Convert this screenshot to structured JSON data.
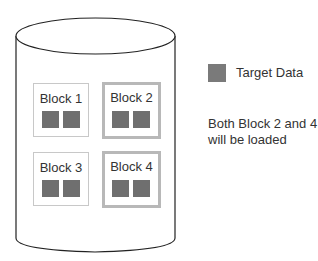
{
  "diagram": {
    "container": "cylinder",
    "blocks": [
      {
        "label": "Block 1",
        "highlighted": false
      },
      {
        "label": "Block 2",
        "highlighted": true
      },
      {
        "label": "Block 3",
        "highlighted": false
      },
      {
        "label": "Block 4",
        "highlighted": true
      }
    ],
    "legend": {
      "label": "Target Data",
      "swatch_color": "#7a7a7a"
    },
    "note": "Both Block 2 and 4 will be loaded"
  }
}
